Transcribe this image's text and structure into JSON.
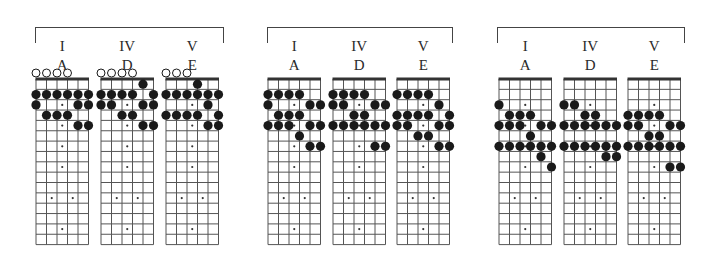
{
  "layout": {
    "strings": 6,
    "frets": 16,
    "string_spacing": 10.5,
    "fret_spacing": 10.35,
    "inlays_single": [
      3,
      5,
      7,
      9,
      15,
      17
    ],
    "inlays_double": [
      12
    ],
    "colors": {
      "line": "#555555",
      "nut": "#333333",
      "note": "#1a1a1a",
      "open": "#ffffff",
      "inlay": "#333333"
    }
  },
  "groups": [
    {
      "bracket": {
        "left": 35,
        "width": 187
      },
      "boards": [
        {
          "roman": "I",
          "key": "A",
          "left": 36,
          "open": [
            0,
            1,
            2,
            3
          ],
          "notes": [
            [
              2,
              0
            ],
            [
              2,
              1
            ],
            [
              2,
              2
            ],
            [
              2,
              3
            ],
            [
              2,
              4
            ],
            [
              2,
              5
            ],
            [
              3,
              0
            ],
            [
              3,
              4
            ],
            [
              3,
              5
            ],
            [
              4,
              1
            ],
            [
              4,
              2
            ],
            [
              4,
              3
            ],
            [
              5,
              4
            ],
            [
              5,
              5
            ]
          ]
        },
        {
          "roman": "IV",
          "key": "D",
          "left": 101,
          "open": [
            0,
            1,
            2,
            3
          ],
          "notes": [
            [
              1,
              4
            ],
            [
              2,
              0
            ],
            [
              2,
              1
            ],
            [
              2,
              2
            ],
            [
              2,
              3
            ],
            [
              2,
              5
            ],
            [
              3,
              0
            ],
            [
              3,
              1
            ],
            [
              3,
              4
            ],
            [
              3,
              5
            ],
            [
              4,
              2
            ],
            [
              4,
              3
            ],
            [
              5,
              4
            ],
            [
              5,
              5
            ]
          ]
        },
        {
          "roman": "V",
          "key": "E",
          "left": 166,
          "open": [
            0,
            1,
            2
          ],
          "notes": [
            [
              1,
              3
            ],
            [
              2,
              0
            ],
            [
              2,
              1
            ],
            [
              2,
              2
            ],
            [
              2,
              3
            ],
            [
              2,
              4
            ],
            [
              2,
              5
            ],
            [
              3,
              4
            ],
            [
              4,
              0
            ],
            [
              4,
              1
            ],
            [
              4,
              2
            ],
            [
              4,
              3
            ],
            [
              4,
              5
            ],
            [
              5,
              4
            ],
            [
              5,
              5
            ]
          ]
        }
      ]
    },
    {
      "bracket": {
        "left": 267,
        "width": 184
      },
      "boards": [
        {
          "roman": "I",
          "key": "A",
          "left": 268,
          "open": [],
          "notes": [
            [
              2,
              0
            ],
            [
              2,
              1
            ],
            [
              2,
              2
            ],
            [
              2,
              3
            ],
            [
              3,
              0
            ],
            [
              3,
              4
            ],
            [
              3,
              5
            ],
            [
              4,
              1
            ],
            [
              4,
              2
            ],
            [
              4,
              3
            ],
            [
              5,
              0
            ],
            [
              5,
              1
            ],
            [
              5,
              2
            ],
            [
              5,
              4
            ],
            [
              5,
              5
            ],
            [
              6,
              3
            ],
            [
              7,
              4
            ],
            [
              7,
              5
            ]
          ]
        },
        {
          "roman": "IV",
          "key": "D",
          "left": 333,
          "open": [],
          "notes": [
            [
              2,
              0
            ],
            [
              2,
              1
            ],
            [
              2,
              2
            ],
            [
              2,
              3
            ],
            [
              3,
              0
            ],
            [
              3,
              1
            ],
            [
              3,
              4
            ],
            [
              3,
              5
            ],
            [
              4,
              2
            ],
            [
              4,
              3
            ],
            [
              5,
              0
            ],
            [
              5,
              1
            ],
            [
              5,
              2
            ],
            [
              5,
              3
            ],
            [
              5,
              4
            ],
            [
              5,
              5
            ],
            [
              7,
              4
            ],
            [
              7,
              5
            ]
          ]
        },
        {
          "roman": "V",
          "key": "E",
          "left": 397,
          "open": [],
          "notes": [
            [
              2,
              0
            ],
            [
              2,
              1
            ],
            [
              2,
              2
            ],
            [
              2,
              3
            ],
            [
              3,
              4
            ],
            [
              4,
              0
            ],
            [
              4,
              1
            ],
            [
              4,
              2
            ],
            [
              4,
              3
            ],
            [
              4,
              5
            ],
            [
              5,
              0
            ],
            [
              5,
              1
            ],
            [
              5,
              4
            ],
            [
              5,
              5
            ],
            [
              6,
              2
            ],
            [
              6,
              3
            ],
            [
              7,
              4
            ],
            [
              7,
              5
            ]
          ]
        }
      ]
    },
    {
      "bracket": {
        "left": 497,
        "width": 186
      },
      "boards": [
        {
          "roman": "I",
          "key": "A",
          "left": 499,
          "open": [],
          "notes": [
            [
              3,
              0
            ],
            [
              4,
              1
            ],
            [
              4,
              2
            ],
            [
              4,
              3
            ],
            [
              5,
              0
            ],
            [
              5,
              1
            ],
            [
              5,
              2
            ],
            [
              5,
              4
            ],
            [
              5,
              5
            ],
            [
              6,
              3
            ],
            [
              7,
              0
            ],
            [
              7,
              1
            ],
            [
              7,
              2
            ],
            [
              7,
              3
            ],
            [
              7,
              4
            ],
            [
              7,
              5
            ],
            [
              8,
              4
            ],
            [
              9,
              5
            ]
          ]
        },
        {
          "roman": "IV",
          "key": "D",
          "left": 564,
          "open": [],
          "notes": [
            [
              3,
              0
            ],
            [
              3,
              1
            ],
            [
              4,
              2
            ],
            [
              4,
              3
            ],
            [
              5,
              0
            ],
            [
              5,
              1
            ],
            [
              5,
              2
            ],
            [
              5,
              3
            ],
            [
              5,
              4
            ],
            [
              5,
              5
            ],
            [
              7,
              0
            ],
            [
              7,
              1
            ],
            [
              7,
              2
            ],
            [
              7,
              3
            ],
            [
              7,
              4
            ],
            [
              7,
              5
            ],
            [
              8,
              4
            ],
            [
              8,
              5
            ]
          ]
        },
        {
          "roman": "V",
          "key": "E",
          "left": 628,
          "open": [],
          "notes": [
            [
              4,
              0
            ],
            [
              4,
              1
            ],
            [
              4,
              2
            ],
            [
              4,
              3
            ],
            [
              5,
              0
            ],
            [
              5,
              1
            ],
            [
              5,
              4
            ],
            [
              5,
              5
            ],
            [
              6,
              2
            ],
            [
              6,
              3
            ],
            [
              7,
              0
            ],
            [
              7,
              1
            ],
            [
              7,
              2
            ],
            [
              7,
              3
            ],
            [
              7,
              4
            ],
            [
              7,
              5
            ],
            [
              9,
              4
            ],
            [
              9,
              5
            ]
          ]
        }
      ]
    }
  ]
}
